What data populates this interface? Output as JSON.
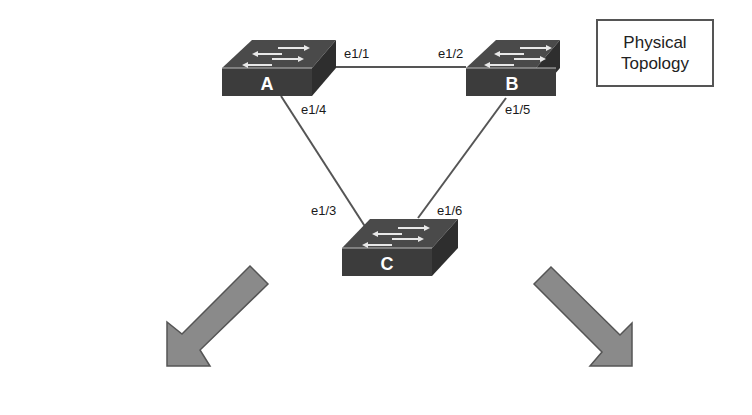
{
  "diagram": {
    "title_line1": "Physical",
    "title_line2": "Topology",
    "colors": {
      "switch_front": "#3c3c3c",
      "switch_top": "#4a4a4a",
      "switch_side": "#2e2e2e",
      "link": "#555555",
      "arrow_fill": "#8a8a8a",
      "arrow_stroke": "#555555"
    },
    "switches": [
      {
        "id": "A",
        "label": "A"
      },
      {
        "id": "B",
        "label": "B"
      },
      {
        "id": "C",
        "label": "C"
      }
    ],
    "links": [
      {
        "from": "A",
        "to": "B",
        "from_port": "e1/1",
        "to_port": "e1/2"
      },
      {
        "from": "A",
        "to": "C",
        "from_port": "e1/4",
        "to_port": "e1/3"
      },
      {
        "from": "B",
        "to": "C",
        "from_port": "e1/5",
        "to_port": "e1/6"
      }
    ],
    "arrows": [
      {
        "direction": "down-left"
      },
      {
        "direction": "down-right"
      }
    ]
  }
}
